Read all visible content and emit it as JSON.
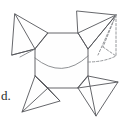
{
  "figure": {
    "label": "d.",
    "caption_position": "bottom-left",
    "colors": {
      "stroke": "#55565a",
      "stroke_soft": "#7a7c80",
      "dashed_stroke": "#8a8c90",
      "face_fill": "#fefefe",
      "background": "#ffffff",
      "label_color": "#2b2b2d"
    },
    "geometry": {
      "center_body": {
        "name": "central-octagon",
        "points": "48,33 78,33 88,49 88,76 78,88 48,88 35,76 35,49"
      },
      "center_arc": {
        "name": "center-arc",
        "path": "M 35,58 Q 62,80 88,56"
      },
      "flaps": [
        {
          "name": "flap-top-left",
          "outline": "15,14 48,33 35,49 12,55",
          "creases": [
            "15,14 35,49",
            "15,14 12,55"
          ]
        },
        {
          "name": "flap-top-right",
          "outline": "78,33 77,11 116,15 88,49",
          "creases": [
            "116,15 78,33",
            "116,15 88,49"
          ]
        },
        {
          "name": "flap-bottom-left",
          "outline": "48,88 35,76 22,112 60,101",
          "creases": [
            "22,112 48,88",
            "35,76 60,101"
          ]
        },
        {
          "name": "flap-bottom-right",
          "outline": "88,76 78,88 96,116 118,82",
          "creases": [
            "118,82 78,88",
            "96,116 88,76"
          ]
        }
      ],
      "dashed_flap": {
        "name": "dashed-fold-flap",
        "segments": [
          "M 116,15 L 103,47",
          "M 116,15 L 116,55",
          "M 116,15 L 99,54",
          "M 103,47 L 116,55",
          "M 103,47 Q 99,57 96,60",
          "M 88,62 Q 104,60 116,55"
        ]
      }
    }
  }
}
